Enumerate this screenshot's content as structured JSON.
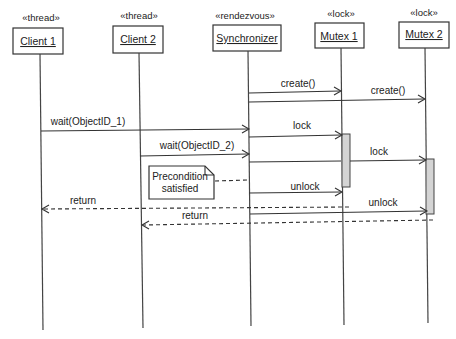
{
  "diagram": {
    "type": "UML sequence diagram",
    "colors": {
      "line": "#333333",
      "activation_fill": "#d4d4d4",
      "background": "#ffffff"
    },
    "participants": [
      {
        "id": "client1",
        "stereotype": "«thread»",
        "name": "Client 1"
      },
      {
        "id": "client2",
        "stereotype": "«thread»",
        "name": "Client 2"
      },
      {
        "id": "synchronizer",
        "stereotype": "«rendezvous»",
        "name": "Synchronizer"
      },
      {
        "id": "mutex1",
        "stereotype": "«lock»",
        "name": "Mutex 1"
      },
      {
        "id": "mutex2",
        "stereotype": "«lock»",
        "name": "Mutex 2"
      }
    ],
    "messages": [
      {
        "from": "Synchronizer",
        "to": "Mutex 1",
        "label": "create()",
        "style": "solid"
      },
      {
        "from": "Synchronizer",
        "to": "Mutex 2",
        "label": "create()",
        "style": "solid"
      },
      {
        "from": "Client 1",
        "to": "Synchronizer",
        "label": "wait(ObjectID_1)",
        "style": "solid"
      },
      {
        "from": "Synchronizer",
        "to": "Mutex 1",
        "label": "lock",
        "style": "solid"
      },
      {
        "from": "Client 2",
        "to": "Synchronizer",
        "label": "wait(ObjectID_2)",
        "style": "solid"
      },
      {
        "from": "Synchronizer",
        "to": "Mutex 2",
        "label": "lock",
        "style": "solid"
      },
      {
        "from": "Synchronizer",
        "to": "Mutex 1",
        "label": "unlock",
        "style": "solid"
      },
      {
        "from": "Mutex 1",
        "to": "Client 1",
        "label": "return",
        "style": "dashed"
      },
      {
        "from": "Synchronizer",
        "to": "Mutex 2",
        "label": "unlock",
        "style": "solid"
      },
      {
        "from": "Mutex 2",
        "to": "Client 2",
        "label": "return",
        "style": "dashed"
      }
    ],
    "note": {
      "lines": [
        "Precondition",
        "satisfied"
      ],
      "attached_to": "Synchronizer"
    }
  }
}
